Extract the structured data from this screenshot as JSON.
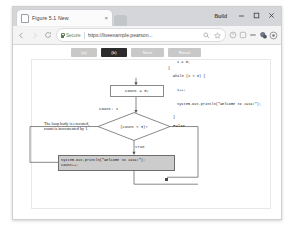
{
  "window": {
    "title": "Build",
    "minimize_label": "Minimize",
    "maximize_label": "Maximize",
    "close_label": "Close"
  },
  "tab": {
    "title": "Figure 5.1 New",
    "close_label": "×",
    "new_tab_label": "New Tab",
    "favicon_name": "page-favicon"
  },
  "toolbar": {
    "back_label": "Back",
    "forward_label": "Forward",
    "reload_label": "Reload",
    "secure_label": "Secure",
    "url": "https://liveexample.pearson...",
    "url_placeholder": "Search Google or type a URL",
    "zoom_icon_label": "Search",
    "bookmark_icon_label": "Bookmark",
    "extension1_label": "Extension",
    "extension2_label": "Extension",
    "extension3_label": "Extension",
    "extension4_label": "Extension",
    "profile_label": "Profile"
  },
  "controls": {
    "buttons": [
      {
        "label": "(a)",
        "active": false
      },
      {
        "label": "(b)",
        "active": true
      },
      {
        "label": "Next",
        "active": false
      },
      {
        "label": "Reset",
        "active": false
      }
    ]
  },
  "code_listing": {
    "line1": "i = 0;",
    "line2": "while (i < 3) {",
    "line3": "i++;",
    "line4": "System.out.println(\"Welcome to Java!\");",
    "line5": "}",
    "brace_marker": "{"
  },
  "flowchart": {
    "init_box": "count = 0;",
    "count_state": "count: 1",
    "decision": "(count < 3)?",
    "false_label": "False",
    "true_label": "true",
    "annotation": "The loop body is executed, count is incremented by 1.",
    "body_statement_line1": "System.out.println(\"Welcome to Java!\");",
    "body_statement_line2": "count++;"
  },
  "colors": {
    "tab_strip": "#d4d6d9",
    "toolbar": "#f4f4f4",
    "button_idle": "#c8c8c8",
    "button_active": "#2b2b2b",
    "body_box_fill": "#cccccc",
    "secure_green": "#5a7d5a"
  }
}
